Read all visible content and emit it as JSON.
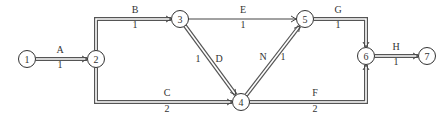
{
  "diagram": {
    "type": "activity-on-arrow network",
    "nodes": [
      {
        "id": "1",
        "label": "1"
      },
      {
        "id": "2",
        "label": "2"
      },
      {
        "id": "3",
        "label": "3"
      },
      {
        "id": "4",
        "label": "4"
      },
      {
        "id": "5",
        "label": "5"
      },
      {
        "id": "6",
        "label": "6"
      },
      {
        "id": "7",
        "label": "7"
      }
    ],
    "edges": [
      {
        "id": "A",
        "from": "1",
        "to": "2",
        "activity": "A",
        "duration": "1",
        "critical": true
      },
      {
        "id": "B",
        "from": "2",
        "to": "3",
        "activity": "B",
        "duration": "1",
        "critical": true
      },
      {
        "id": "C",
        "from": "2",
        "to": "4",
        "activity": "C",
        "duration": "2",
        "critical": true
      },
      {
        "id": "D",
        "from": "3",
        "to": "4",
        "activity": "D",
        "duration": "1",
        "critical": true
      },
      {
        "id": "E",
        "from": "3",
        "to": "5",
        "activity": "E",
        "duration": "1",
        "critical": false
      },
      {
        "id": "N",
        "from": "4",
        "to": "5",
        "activity": "N",
        "duration": "1",
        "critical": true
      },
      {
        "id": "F",
        "from": "4",
        "to": "6",
        "activity": "F",
        "duration": "2",
        "critical": true
      },
      {
        "id": "G",
        "from": "5",
        "to": "6",
        "activity": "G",
        "duration": "1",
        "critical": true
      },
      {
        "id": "H",
        "from": "6",
        "to": "7",
        "activity": "H",
        "duration": "1",
        "critical": true
      }
    ]
  }
}
